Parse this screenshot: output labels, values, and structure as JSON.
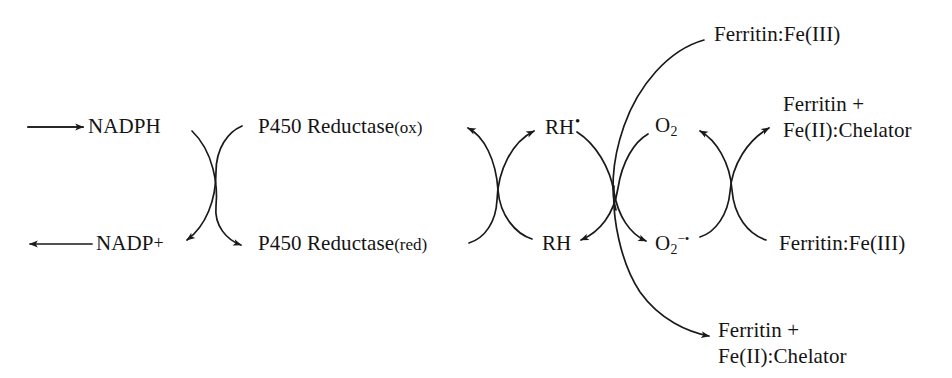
{
  "diagram": {
    "stroke_color": "#1a1a1a",
    "background_color": "#ffffff",
    "nodes": {
      "nadph": "NADPH",
      "nadp_plus_base": "NADP",
      "nadp_plus_charge": "+",
      "p450_reductase_ox_name": "P450 Reductase",
      "p450_reductase_ox_state": "(ox)",
      "p450_reductase_red_name": "P450 Reductase",
      "p450_reductase_red_state": "(red)",
      "rh_radical_base": "RH",
      "rh_radical_dot": "•",
      "rh": "RH",
      "o2_base": "O",
      "o2_subscript": "2",
      "superoxide_base": "O",
      "superoxide_subscript": "2",
      "superoxide_charge": "−•",
      "ferritin_fe3_top": "Ferritin:Fe(III)",
      "ferritin_fe3_right": "Ferritin:Fe(III)",
      "ferritin_chelator_right_line1": "Ferritin +",
      "ferritin_chelator_right_line2": "Fe(II):Chelator",
      "ferritin_chelator_bottom_line1": "Ferritin +",
      "ferritin_chelator_bottom_line2": "Fe(II):Chelator"
    },
    "arrows": [
      {
        "id": "input-to-nadph",
        "kind": "straight",
        "label": "input arrow into NADPH"
      },
      {
        "id": "nadp-to-output",
        "kind": "straight",
        "label": "output arrow from NADP+"
      },
      {
        "id": "nadph-to-reductase-red",
        "kind": "curve",
        "label": "NADPH to P450 Reductase (red)"
      },
      {
        "id": "reductase-ox-to-nadp",
        "kind": "curve",
        "label": "P450 Reductase (ox) to NADP+"
      },
      {
        "id": "reductase-red-to-rh-radical",
        "kind": "curve",
        "label": "P450 Reductase (red) to RH radical"
      },
      {
        "id": "rh-to-reductase-ox",
        "kind": "curve",
        "label": "RH to P450 Reductase (ox)"
      },
      {
        "id": "rh-radical-to-superoxide",
        "kind": "curve",
        "label": "RH radical to superoxide"
      },
      {
        "id": "o2-to-rh",
        "kind": "curve",
        "label": "O2 to RH"
      },
      {
        "id": "superoxide-to-ferritin-chelator",
        "kind": "curve",
        "label": "superoxide to Ferritin + Fe(II):Chelator"
      },
      {
        "id": "ferritin-fe3-to-o2",
        "kind": "curve",
        "label": "Ferritin:Fe(III) to O2"
      },
      {
        "id": "ferritin-fe3-top-to-node",
        "kind": "long-curve",
        "label": "Ferritin:Fe(III) top into crossing node"
      },
      {
        "id": "node-to-ferritin-chelator-bottom",
        "kind": "long-curve",
        "label": "crossing node to Ferritin + Fe(II):Chelator bottom"
      }
    ]
  }
}
